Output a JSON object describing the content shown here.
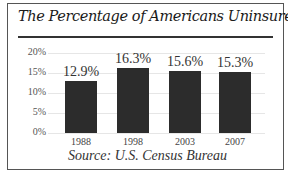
{
  "chart_data": {
    "type": "bar",
    "title": "The Percentage of Americans Uninsured",
    "categories": [
      "1988",
      "1998",
      "2003",
      "2007"
    ],
    "values": [
      12.9,
      16.3,
      15.6,
      15.3
    ],
    "value_labels": [
      "12.9%",
      "16.3%",
      "15.6%",
      "15.3%"
    ],
    "xlabel": "",
    "ylabel": "",
    "ylim": [
      0,
      20
    ],
    "yticks": [
      "0%",
      "5%",
      "10%",
      "15%",
      "20%"
    ],
    "grid": true,
    "legend": null,
    "annotation": "Source: U.S. Census Bureau",
    "bar_color": "#2c2c2c"
  },
  "labels": {
    "title": "The Percentage of Americans Uninsured",
    "source": "Source: U.S. Census Bureau"
  }
}
